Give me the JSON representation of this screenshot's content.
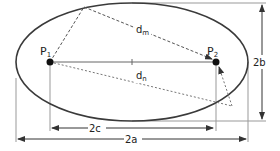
{
  "diagram": {
    "foci": [
      {
        "label": "P",
        "subscript": "1"
      },
      {
        "label": "P",
        "subscript": "2"
      }
    ],
    "distances": [
      {
        "label": "d",
        "subscript": "m"
      },
      {
        "label": "d",
        "subscript": "n"
      }
    ],
    "dimensions": {
      "focal_distance": "2c",
      "major_axis": "2a",
      "minor_axis": "2b"
    },
    "colors": {
      "ellipse": "#3a3a3a",
      "lines": "#555555",
      "guides": "#888888",
      "points": "#111111"
    }
  }
}
